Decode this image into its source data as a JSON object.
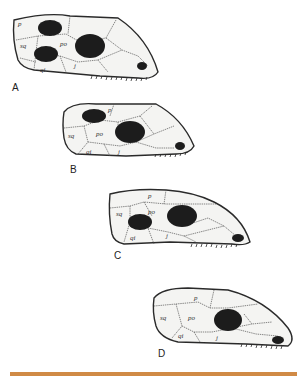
{
  "figure": {
    "panels": [
      {
        "id": "A",
        "label": "A",
        "regions": {
          "p": "p",
          "sq": "sq",
          "po": "po",
          "qi": "qi",
          "j": "j"
        }
      },
      {
        "id": "B",
        "label": "B",
        "regions": {
          "p": "p",
          "sq": "sq",
          "po": "po",
          "qi": "qi",
          "j": "j"
        }
      },
      {
        "id": "C",
        "label": "C",
        "regions": {
          "p": "p",
          "sq": "sq",
          "po": "po",
          "qi": "qi",
          "j": "j"
        }
      },
      {
        "id": "D",
        "label": "D",
        "regions": {
          "p": "p",
          "sq": "sq",
          "po": "po",
          "qi": "qi",
          "j": "j"
        }
      }
    ],
    "colors": {
      "outline": "#2a2a2a",
      "fill": "#f4f4f2",
      "spot": "#1c1c1c",
      "vein": "#555555",
      "rule": "#d08a45"
    }
  }
}
